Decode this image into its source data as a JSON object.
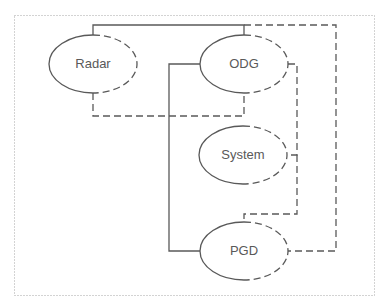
{
  "diagram": {
    "type": "connection-diagram",
    "nodes": [
      {
        "id": "radar",
        "label": "Radar",
        "cx": 93,
        "cy": 64,
        "rx": 44,
        "ry": 29
      },
      {
        "id": "odg",
        "label": "ODG",
        "cx": 244,
        "cy": 64,
        "rx": 44,
        "ry": 29
      },
      {
        "id": "system",
        "label": "System",
        "cx": 243,
        "cy": 155,
        "rx": 44,
        "ry": 29
      },
      {
        "id": "pgd",
        "label": "PGD",
        "cx": 244,
        "cy": 251,
        "rx": 44,
        "ry": 29
      }
    ],
    "edges": [
      {
        "from": "radar",
        "to": "odg",
        "style": "solid",
        "route": "top"
      },
      {
        "from": "radar",
        "to": "odg",
        "style": "dashed",
        "route": "bottom"
      },
      {
        "from": "odg",
        "to": "pgd",
        "style": "solid",
        "route": "left"
      },
      {
        "from": "odg",
        "to": "pgd",
        "style": "dashed",
        "route": "outer-right"
      },
      {
        "from": "odg",
        "to": "system",
        "style": "dashed",
        "route": "right"
      },
      {
        "from": "system",
        "to": "pgd",
        "style": "dashed",
        "route": "right"
      }
    ],
    "colors": {
      "line": "#595959",
      "border": "#a6a6a6",
      "text": "#595959"
    }
  }
}
